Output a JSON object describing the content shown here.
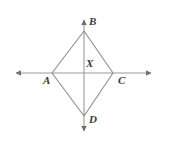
{
  "figure": {
    "name": "rhombus-with-diagonals-on-axes",
    "background_color": "#ffffff",
    "line_color": "#8d8d8d",
    "axis_color": "#9a9a9a",
    "label_color": "#3a3a3a",
    "labels": {
      "top_vertex": "B",
      "left_vertex": "A",
      "right_vertex": "C",
      "bottom_vertex": "D",
      "center_point": "X"
    },
    "points": {
      "B": {
        "x": 84,
        "y": 31
      },
      "A": {
        "x": 52,
        "y": 73
      },
      "C": {
        "x": 113,
        "y": 73
      },
      "D": {
        "x": 84,
        "y": 116
      },
      "X": {
        "x": 84,
        "y": 73
      }
    },
    "axes": {
      "horizontal": {
        "x1": 11,
        "y1": 73,
        "x2": 156,
        "y2": 73,
        "arrows": "both"
      },
      "vertical": {
        "x1": 84,
        "y1": 15,
        "x2": 84,
        "y2": 136,
        "arrows": "both"
      }
    },
    "edges": [
      {
        "from": "A",
        "to": "B"
      },
      {
        "from": "B",
        "to": "C"
      },
      {
        "from": "C",
        "to": "D"
      },
      {
        "from": "D",
        "to": "A"
      }
    ]
  }
}
